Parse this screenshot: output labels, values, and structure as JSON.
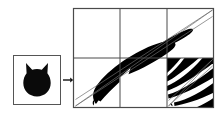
{
  "figure": {
    "type": "iterated-function-system-diagram",
    "caption_text": "",
    "background_color": "#ffffff",
    "ink_color": "#000000",
    "frame_color": "#4a4a4a",
    "guide_line_color": "#6b6b6b",
    "source_panel": {
      "name": "source-set",
      "label": "",
      "shape_name": "cat-head-silhouette",
      "fill_color": "#0a0a0a",
      "frame": {
        "x": 13,
        "y": 55,
        "width": 48,
        "height": 50
      }
    },
    "arrow": {
      "name": "transform-arrow",
      "glyph": "→",
      "label": "",
      "x1": 63,
      "y1": 80,
      "x2": 72,
      "y2": 80
    },
    "target_panel": {
      "name": "image-set",
      "label": "",
      "frame": {
        "x": 73,
        "y": 8,
        "width": 141,
        "height": 100
      },
      "grid": {
        "columns": 3,
        "rows": 2,
        "vertical_dividers_x": [
          120,
          167
        ],
        "horizontal_dividers_y": [
          58
        ]
      },
      "guide_lines": [
        {
          "name": "diagonal-main",
          "x1": 75,
          "y1": 106,
          "x2": 212,
          "y2": 10
        },
        {
          "name": "diagonal-upper",
          "x1": 75,
          "y1": 106,
          "x2": 212,
          "y2": 10
        },
        {
          "name": "diagonal-lower",
          "x1": 75,
          "y1": 106,
          "x2": 212,
          "y2": 10
        }
      ],
      "cells": [
        {
          "name": "cell-r1c1",
          "row": 1,
          "col": 1,
          "content": "empty"
        },
        {
          "name": "cell-r1c2",
          "row": 1,
          "col": 2,
          "content": "empty"
        },
        {
          "name": "cell-r1c3",
          "row": 1,
          "col": 3,
          "content": "streak"
        },
        {
          "name": "cell-r2c1",
          "row": 2,
          "col": 1,
          "content": "streak"
        },
        {
          "name": "cell-r2c2",
          "row": 2,
          "col": 2,
          "content": "streak"
        },
        {
          "name": "cell-r2c3",
          "row": 2,
          "col": 3,
          "content": "dense-striped-fractal"
        }
      ]
    }
  },
  "chart_data": {
    "type": "diagram",
    "title": "",
    "panels": [
      "source-set",
      "image-set"
    ],
    "grid_columns": 3,
    "grid_rows": 2
  }
}
